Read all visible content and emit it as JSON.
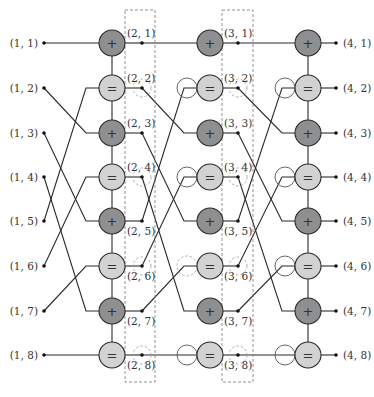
{
  "diagram": {
    "type": "factor-graph",
    "rows": 8,
    "colors": {
      "plus_node": "#8f8f8f",
      "equal_node": "#d2d2d2",
      "wire": "#2a2a2a",
      "dashed": "#777777"
    },
    "node_symbols": {
      "plus": "+",
      "equal": "="
    },
    "column1_labels": [
      "(1, 1)",
      "(1, 2)",
      "(1, 3)",
      "(1, 4)",
      "(1, 5)",
      "(1, 6)",
      "(1, 7)",
      "(1, 8)"
    ],
    "column2_labels": [
      "(2, 1)",
      "(2, 2)",
      "(2, 3)",
      "(2, 4)",
      "(2, 5)",
      "(2, 6)",
      "(2, 7)",
      "(2, 8)"
    ],
    "column3_labels": [
      "(3, 1)",
      "(3, 2)",
      "(3, 3)",
      "(3, 4)",
      "(3, 5)",
      "(3, 6)",
      "(3, 7)",
      "(3, 8)"
    ],
    "column4_labels": [
      "(4, 1)",
      "(4, 2)",
      "(4, 3)",
      "(4, 4)",
      "(4, 5)",
      "(4, 6)",
      "(4, 7)",
      "(4, 8)"
    ],
    "node_types": [
      "plus",
      "equal",
      "plus",
      "equal",
      "plus",
      "equal",
      "plus",
      "equal"
    ],
    "permutation": [
      1,
      5,
      2,
      6,
      3,
      7,
      4,
      8
    ]
  }
}
